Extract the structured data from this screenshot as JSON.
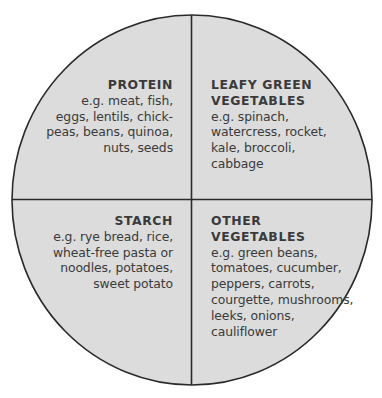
{
  "diagram": {
    "type": "plate-quadrants",
    "colors": {
      "fill": "#dcdcdc",
      "outline": "#2a2a2a",
      "text": "#2b2b2b",
      "background": "#ffffff"
    },
    "quadrants": [
      {
        "id": "protein",
        "position": "top-left",
        "title_lines": [
          "PROTEIN"
        ],
        "body_lines": [
          "e.g. meat, fish,",
          "eggs, lentils, chick-",
          "peas, beans, quinoa,",
          "nuts, seeds"
        ]
      },
      {
        "id": "leafy-green-vegetables",
        "position": "top-right",
        "title_lines": [
          "LEAFY GREEN",
          "VEGETABLES"
        ],
        "body_lines": [
          "e.g. spinach,",
          "watercress, rocket,",
          "kale, broccoli,",
          "cabbage"
        ]
      },
      {
        "id": "starch",
        "position": "bottom-left",
        "title_lines": [
          "STARCH"
        ],
        "body_lines": [
          "e.g. rye bread, rice,",
          "wheat-free pasta or",
          "noodles, potatoes,",
          "sweet potato"
        ]
      },
      {
        "id": "other-vegetables",
        "position": "bottom-right",
        "title_lines": [
          "OTHER",
          "VEGETABLES"
        ],
        "body_lines": [
          "e.g. green beans,",
          "tomatoes, cucumber,",
          "peppers, carrots,",
          "courgette, mushrooms,",
          "leeks, onions,",
          "cauliflower"
        ]
      }
    ]
  }
}
